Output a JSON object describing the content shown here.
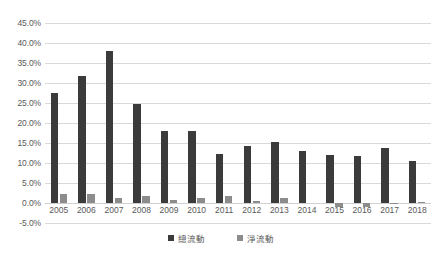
{
  "chart_data": {
    "type": "bar",
    "title": "",
    "xlabel": "",
    "ylabel": "",
    "ylim": [
      -5.0,
      45.0
    ],
    "ytick_step": 5.0,
    "ytick_labels": [
      "45.0%",
      "40.0%",
      "35.0%",
      "30.0%",
      "25.0%",
      "20.0%",
      "15.0%",
      "10.0%",
      "5.0%",
      "0.0%",
      "-5.0%"
    ],
    "ytick_values": [
      45.0,
      40.0,
      35.0,
      30.0,
      25.0,
      20.0,
      15.0,
      10.0,
      5.0,
      0.0,
      -5.0
    ],
    "grid": true,
    "legend_position": "bottom",
    "categories": [
      "2005",
      "2006",
      "2007",
      "2008",
      "2009",
      "2010",
      "2011",
      "2012",
      "2013",
      "2014",
      "2015",
      "2016",
      "2017",
      "2018"
    ],
    "series": [
      {
        "name": "總流動",
        "color": "#3b3b3b",
        "values": [
          27.4,
          31.7,
          38.1,
          24.7,
          18.0,
          17.9,
          12.3,
          14.3,
          15.2,
          13.0,
          11.9,
          11.8,
          13.7,
          10.5
        ]
      },
      {
        "name": "淨流動",
        "color": "#8c8c8c",
        "values": [
          2.2,
          2.2,
          1.2,
          1.7,
          0.8,
          1.3,
          1.8,
          0.4,
          1.2,
          0.0,
          -0.9,
          -0.9,
          -0.1,
          0.2
        ]
      }
    ]
  },
  "legend": {
    "items": [
      {
        "label": "總流動",
        "marker": "square-marker"
      },
      {
        "label": "淨流動",
        "marker": "square-marker"
      }
    ]
  }
}
